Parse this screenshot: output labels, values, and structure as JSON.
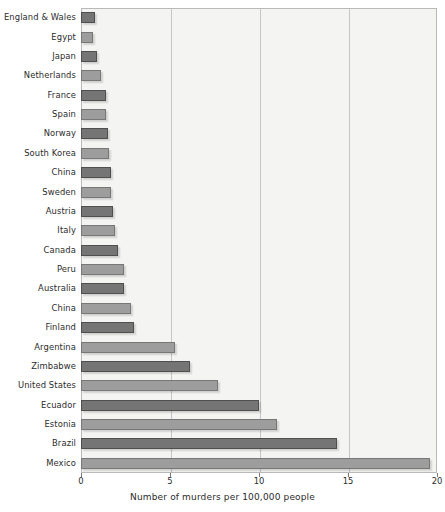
{
  "chart_data": {
    "type": "bar",
    "orientation": "horizontal",
    "title": "",
    "xlabel": "Number of murders per 100,000 people",
    "ylabel": "",
    "xlim": [
      0,
      20
    ],
    "xticks": [
      0,
      5,
      10,
      15,
      20
    ],
    "xtick_labels": [
      "0",
      "5",
      "10",
      "15",
      "20"
    ],
    "grid": true,
    "grid_axis": "x",
    "legend": "none",
    "categories": [
      "England & Wales",
      "Egypt",
      "Japan",
      "Netherlands",
      "France",
      "Spain",
      "Norway",
      "South Korea",
      "China",
      "Sweden",
      "Austria",
      "Italy",
      "Canada",
      "Peru",
      "Australia",
      "China",
      "Finland",
      "Argentina",
      "Zimbabwe",
      "United States",
      "Ecuador",
      "Estonia",
      "Brazil",
      "Mexico"
    ],
    "values": [
      0.8,
      0.7,
      0.9,
      1.1,
      1.4,
      1.4,
      1.5,
      1.6,
      1.7,
      1.7,
      1.8,
      1.9,
      2.1,
      2.4,
      2.4,
      2.8,
      3.0,
      5.3,
      6.1,
      7.7,
      10.0,
      11.0,
      14.4,
      19.6
    ],
    "bar_shades": [
      "dark",
      "light",
      "dark",
      "light",
      "dark",
      "light",
      "dark",
      "light",
      "dark",
      "light",
      "dark",
      "light",
      "dark",
      "light",
      "dark",
      "light",
      "dark",
      "light",
      "dark",
      "light",
      "dark",
      "light",
      "dark",
      "light"
    ],
    "colors": {
      "bar_dark": "#757575",
      "bar_light": "#9d9d9d",
      "bar_border": "#5e5e5e",
      "plot_background": "#f4f4f2",
      "gridline": "#c6c6c6",
      "axis": "#b9b9b9",
      "text": "#2b2b2b"
    }
  }
}
